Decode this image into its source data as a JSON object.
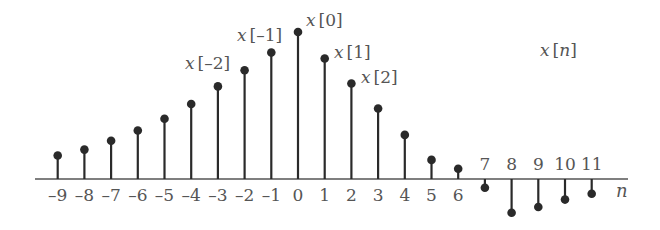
{
  "chart_data": {
    "type": "stem",
    "title": "x[n]",
    "xlabel": "n",
    "ylabel": "",
    "grid": false,
    "legend": null,
    "x": [
      -9,
      -8,
      -7,
      -6,
      -5,
      -4,
      -3,
      -2,
      -1,
      0,
      1,
      2,
      3,
      4,
      5,
      6,
      7,
      8,
      9,
      10,
      11
    ],
    "values": [
      0.16,
      0.2,
      0.26,
      0.33,
      0.41,
      0.51,
      0.63,
      0.74,
      0.86,
      1.0,
      0.82,
      0.65,
      0.48,
      0.3,
      0.13,
      0.07,
      -0.06,
      -0.23,
      -0.19,
      -0.14,
      -0.1
    ],
    "tick_labels": [
      "–9",
      "–8",
      "–7",
      "–6",
      "–5",
      "–4",
      "–3",
      "–2",
      "–1",
      "0",
      "1",
      "2",
      "3",
      "4",
      "5",
      "6",
      "7",
      "8",
      "9",
      "10",
      "11"
    ],
    "annotations": [
      {
        "text": "x[–2]",
        "n": -2
      },
      {
        "text": "x[–1]",
        "n": -1
      },
      {
        "text": "x[0]",
        "n": 0
      },
      {
        "text": "x[1]",
        "n": 1
      },
      {
        "text": "x[2]",
        "n": 2
      }
    ],
    "ylim": [
      -0.3,
      1.05
    ],
    "xlim": [
      -10,
      12
    ]
  },
  "labels": {
    "signal_name": "x[n]",
    "axis_name": "n"
  },
  "style": {
    "stem_color": "#2a2a2a",
    "axis_color": "#555555",
    "text_color": "#555555"
  }
}
